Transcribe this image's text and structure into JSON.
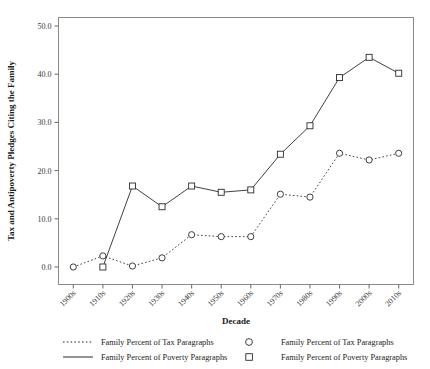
{
  "chart_data": {
    "type": "line",
    "title": "",
    "xlabel": "Decade",
    "ylabel": "Tax and Antipoverty Pledges Citing the Family",
    "categories": [
      "1900s",
      "1910s",
      "1920s",
      "1930s",
      "1940s",
      "1950s",
      "1960s",
      "1970s",
      "1980s",
      "1990s",
      "2000s",
      "2010s"
    ],
    "ylim": [
      0.0,
      50.0
    ],
    "yticks": [
      0.0,
      10.0,
      20.0,
      30.0,
      40.0,
      50.0
    ],
    "ytick_labels": [
      "0.0",
      "10.0",
      "20.0",
      "30.0",
      "40.0",
      "50.0"
    ],
    "grid": false,
    "legend_position": "below",
    "series": [
      {
        "name": "Family Percent of Tax Paragraphs",
        "marker": "circle",
        "linestyle": "dotted",
        "color": "#2b2b2b",
        "values": [
          0.0,
          2.3,
          0.2,
          1.9,
          6.7,
          6.3,
          6.3,
          15.1,
          14.5,
          23.6,
          22.2,
          23.6
        ]
      },
      {
        "name": "Family Percent of Poverty Paragraphs",
        "marker": "square",
        "linestyle": "solid",
        "color": "#2b2b2b",
        "values": [
          null,
          0.0,
          16.8,
          12.5,
          16.8,
          15.5,
          16.0,
          23.4,
          29.3,
          39.3,
          43.5,
          40.2
        ]
      }
    ]
  },
  "legend": {
    "entries": [
      {
        "label": "Family Percent of Tax Paragraphs",
        "swatch": "dotted-line"
      },
      {
        "label": "Family Percent of Tax Paragraphs",
        "swatch": "circle-marker"
      },
      {
        "label": "Family Percent of Poverty Paragraphs",
        "swatch": "solid-line"
      },
      {
        "label": "Family Percent of Poverty Paragraphs",
        "swatch": "square-marker"
      }
    ]
  }
}
